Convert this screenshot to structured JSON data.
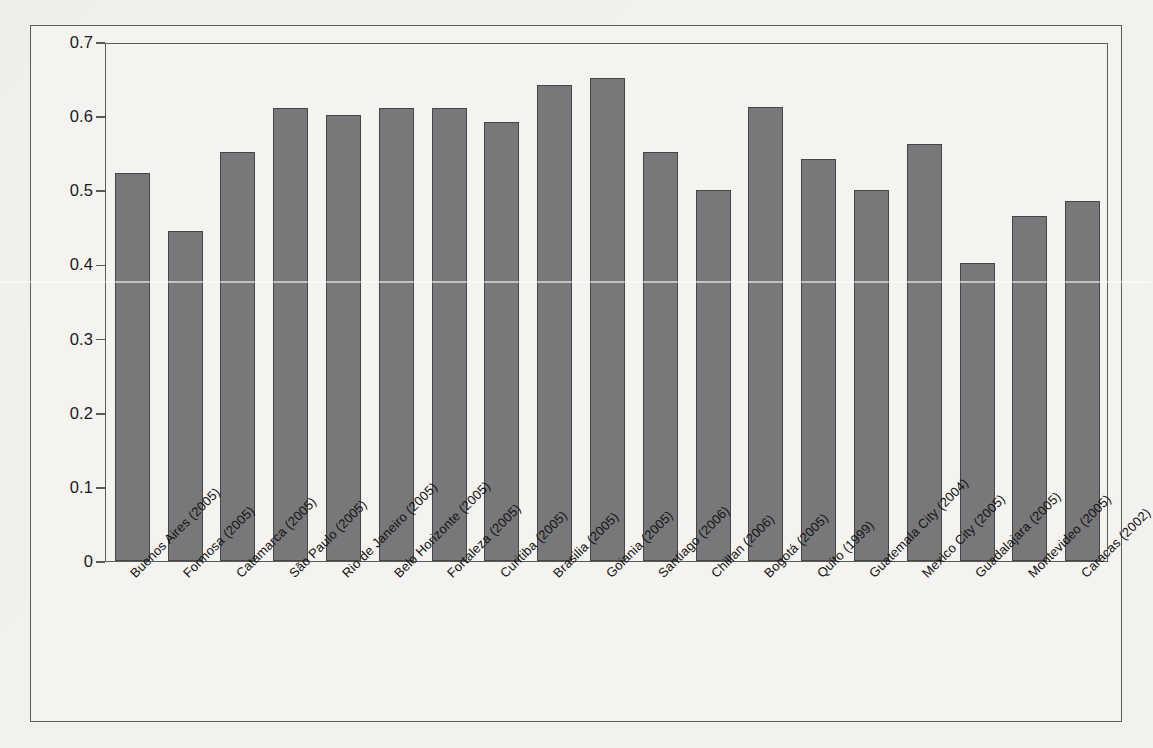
{
  "chart_data": {
    "type": "bar",
    "title": "",
    "subtitle": "",
    "xlabel": "",
    "ylabel": "Gini coefficient",
    "ylim": [
      0,
      0.7
    ],
    "ytick_values": [
      0,
      0.1,
      0.2,
      0.3,
      0.4,
      0.5,
      0.6,
      0.7
    ],
    "ytick_labels": [
      "0",
      "0.1",
      "0.2",
      "0.3",
      "0.4",
      "0.5",
      "0.6",
      "0.7"
    ],
    "grid": false,
    "legend": null,
    "bar_color": "#78787b",
    "bar_edge_color": "#45454a",
    "background_color": "#f4f3f0",
    "categories": [
      "Buenos Aires (2005)",
      "Formosa (2005)",
      "Catamarca (2005)",
      "São Paulo (2005)",
      "Rio de Janeiro (2005)",
      "Belo Horizonte (2005)",
      "Fortaleza (2005)",
      "Curitiba (2005)",
      "Brasilia (2005)",
      "Goiania (2005)",
      "Santiago (2006)",
      "Chillan (2006)",
      "Bogotá (2005)",
      "Quito (1999)",
      "Guatemala City (2004)",
      "Mexico City (2005)",
      "Guadalajara (2005)",
      "Montevideo (2005)",
      "Caracas (2002)"
    ],
    "values": [
      0.523,
      0.445,
      0.552,
      0.611,
      0.602,
      0.611,
      0.611,
      0.592,
      0.642,
      0.652,
      0.552,
      0.501,
      0.612,
      0.542,
      0.501,
      0.562,
      0.402,
      0.466,
      0.486
    ]
  }
}
